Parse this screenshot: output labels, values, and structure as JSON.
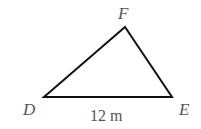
{
  "diagram": {
    "type": "triangle",
    "vertices": [
      {
        "label": "D",
        "x": 44,
        "y": 97
      },
      {
        "label": "E",
        "x": 172,
        "y": 97
      },
      {
        "label": "F",
        "x": 125,
        "y": 27
      }
    ],
    "side_labels": {
      "DE": "12 m"
    },
    "labels": {
      "D": "D",
      "E": "E",
      "F": "F",
      "side_DE": "12 m"
    },
    "colors": {
      "stroke": "#111111",
      "text": "#555555"
    }
  }
}
